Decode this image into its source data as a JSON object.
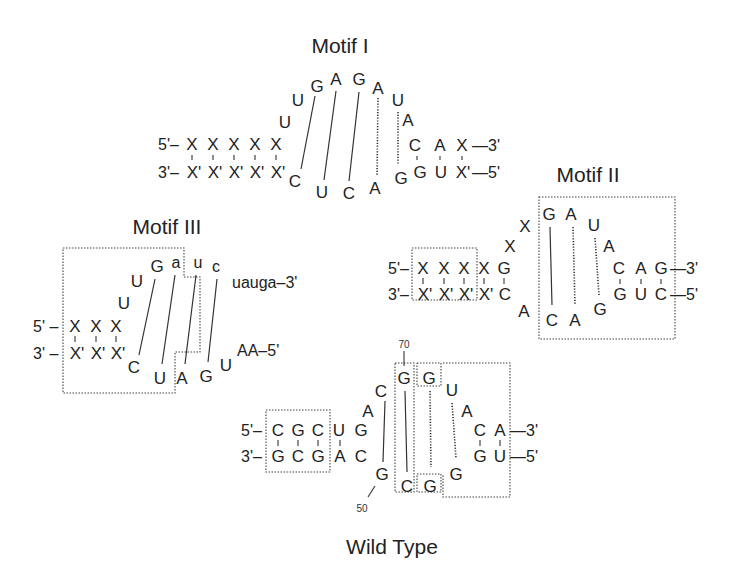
{
  "titles": {
    "motif1": "Motif I",
    "motif2": "Motif II",
    "motif3": "Motif III",
    "wild": "Wild Type"
  },
  "numbers": {
    "n70": "70",
    "n50": "50"
  },
  "motif1": {
    "top_strand": {
      "prefix": "5'–",
      "bases": [
        "X",
        "X",
        "X",
        "X",
        "X"
      ]
    },
    "bottom_strand": {
      "prefix": "3'–",
      "bases": [
        "X'",
        "X'",
        "X'",
        "X'",
        "X'"
      ]
    },
    "loop_top": [
      "U",
      "U",
      "G",
      "A",
      "G",
      "A",
      "U",
      "A"
    ],
    "loop_bottom": [
      "C",
      "U",
      "C",
      "A",
      "G"
    ],
    "right_top": {
      "bases": [
        "C",
        "A",
        "X"
      ],
      "suffix": "—3'"
    },
    "right_bottom": {
      "bases": [
        "G",
        "U",
        "X'"
      ],
      "suffix": "—5'"
    }
  },
  "motif2": {
    "top_strand": {
      "prefix": "5'–",
      "bases": [
        "X",
        "X",
        "X",
        "X",
        "G"
      ]
    },
    "bottom_strand": {
      "prefix": "3'–",
      "bases": [
        "X'",
        "X'",
        "X'",
        "X'",
        "C"
      ]
    },
    "linker": [
      "X",
      "X"
    ],
    "bulge_bottom": "A",
    "loop_top": [
      "G",
      "A",
      "U",
      "A"
    ],
    "loop_bottom": [
      "C",
      "A",
      "G"
    ],
    "right_top": {
      "bases": [
        "C",
        "A",
        "G"
      ],
      "suffix": "—3'"
    },
    "right_bottom": {
      "bases": [
        "G",
        "U",
        "C"
      ],
      "suffix": "—5'"
    }
  },
  "motif3": {
    "top_strand": {
      "prefix": "5' –",
      "bases": [
        "X",
        "X",
        "X"
      ]
    },
    "bottom_strand": {
      "prefix": "3' –",
      "bases": [
        "X'",
        "X'",
        "X'"
      ]
    },
    "loop_top": [
      "U",
      "U",
      "G",
      "a",
      "u",
      "c"
    ],
    "tail_top": "uauga–3'",
    "loop_bottom": [
      "C",
      "U",
      "A",
      "G",
      "U"
    ],
    "tail_bottom": "AA–5'"
  },
  "wild_type": {
    "top_strand": {
      "prefix": "5'–",
      "bases": [
        "C",
        "G",
        "C",
        "U",
        "G"
      ]
    },
    "bottom_strand": {
      "prefix": "3'–",
      "bases": [
        "G",
        "C",
        "G",
        "A",
        "C"
      ]
    },
    "loop_top": [
      "A",
      "C",
      "G",
      "G",
      "U",
      "A"
    ],
    "loop_bottom": [
      "G",
      "C",
      "G",
      "G"
    ],
    "right_top": {
      "bases": [
        "C",
        "A"
      ],
      "suffix": "—3'"
    },
    "right_bottom": {
      "bases": [
        "G",
        "U"
      ],
      "suffix": "—5'"
    }
  }
}
